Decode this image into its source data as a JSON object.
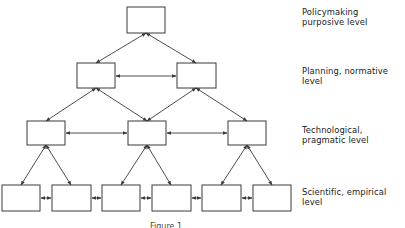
{
  "diagram": {
    "type": "hierarchy",
    "colors": {
      "stroke": "#3a3a3a",
      "background": "#ffffff",
      "text": "#1a1a1a"
    },
    "levels": [
      {
        "id": "policymaking",
        "label_line1": "Policymaking",
        "label_line2": "purposive level",
        "box_count": 1
      },
      {
        "id": "planning",
        "label_line1": "Planning, normative",
        "label_line2": "level",
        "box_count": 2
      },
      {
        "id": "technological",
        "label_line1": "Technological,",
        "label_line2": "pragmatic level",
        "box_count": 3
      },
      {
        "id": "scientific",
        "label_line1": "Scientific, empirical",
        "label_line2": "level",
        "box_count": 6
      }
    ],
    "caption": "Figure 1"
  }
}
